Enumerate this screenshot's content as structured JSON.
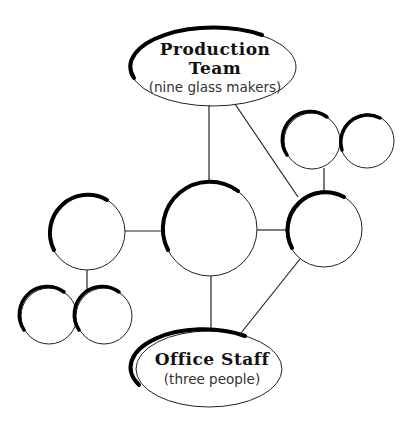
{
  "diagram": {
    "type": "network",
    "colors": {
      "line": "#222222",
      "fill": "#ffffff",
      "shadow": "#000000"
    },
    "nodes": {
      "production_team": {
        "title_line1": "Production",
        "title_line2": "Team",
        "subtitle": "(nine glass makers)"
      },
      "office_staff": {
        "title": "Office Staff",
        "subtitle": "(three people)"
      },
      "center": {
        "label": ""
      },
      "right": {
        "label": ""
      },
      "left": {
        "label": ""
      },
      "top_right_a": {
        "label": ""
      },
      "top_right_b": {
        "label": ""
      },
      "bottom_left_a": {
        "label": ""
      },
      "bottom_left_b": {
        "label": ""
      }
    },
    "edges": [
      [
        "production_team",
        "center"
      ],
      [
        "production_team",
        "right"
      ],
      [
        "right",
        "top_right_a"
      ],
      [
        "center",
        "right"
      ],
      [
        "left",
        "center"
      ],
      [
        "left",
        "bottom_left_b"
      ],
      [
        "center",
        "office_staff"
      ],
      [
        "right",
        "office_staff"
      ]
    ]
  }
}
